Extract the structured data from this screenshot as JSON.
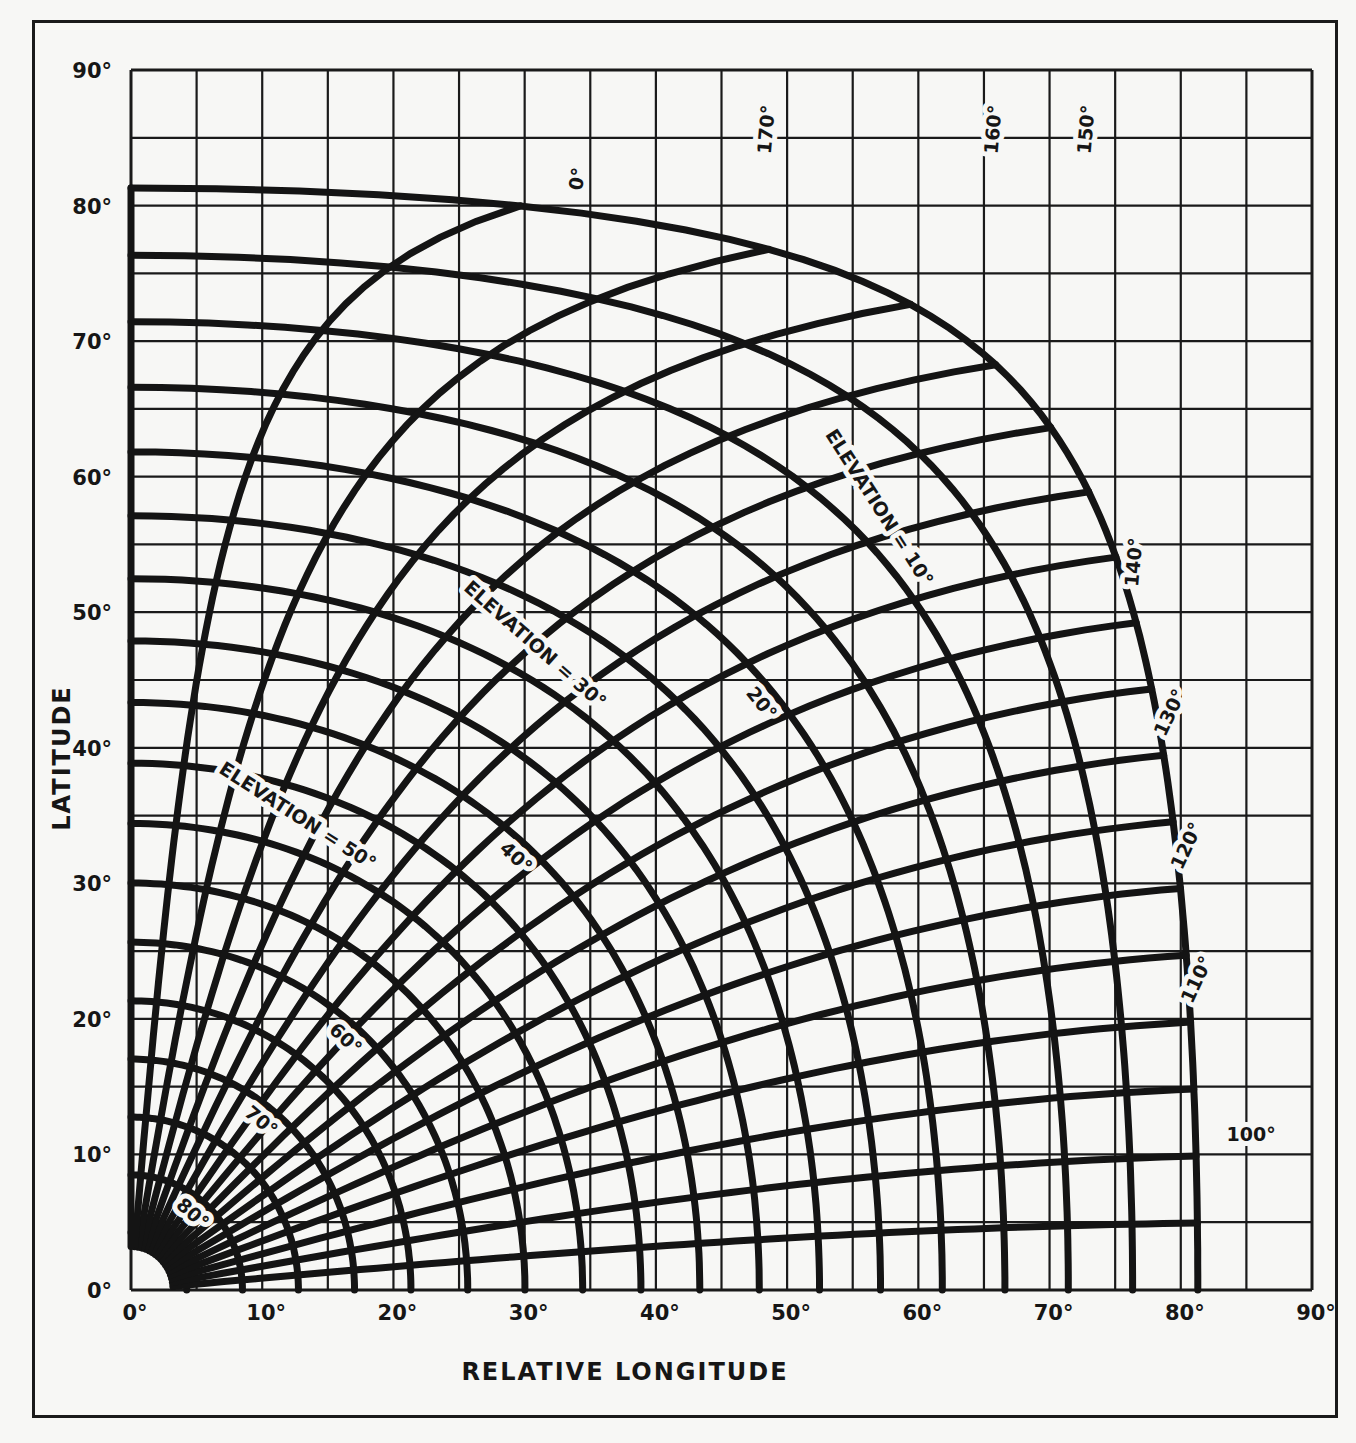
{
  "chart_data": {
    "type": "line",
    "title": "",
    "xlabel": "RELATIVE LONGITUDE",
    "ylabel": "LATITUDE",
    "xlim": [
      0,
      90
    ],
    "ylim": [
      0,
      90
    ],
    "grid": true,
    "grid_spacing_deg": 5,
    "x_ticks": [
      "0°",
      "10°",
      "20°",
      "30°",
      "40°",
      "50°",
      "60°",
      "70°",
      "80°",
      "90°"
    ],
    "y_ticks": [
      "0°",
      "10°",
      "20°",
      "30°",
      "40°",
      "50°",
      "60°",
      "70°",
      "80°",
      "90°"
    ],
    "elevation_curves_deg": [
      0,
      5,
      10,
      15,
      20,
      25,
      30,
      35,
      40,
      45,
      50,
      55,
      60,
      65,
      70,
      75,
      80,
      85
    ],
    "azimuth_curves_deg": [
      95,
      100,
      105,
      110,
      115,
      120,
      125,
      130,
      135,
      140,
      145,
      150,
      155,
      160,
      165,
      170,
      175,
      180
    ],
    "elevation_labels": [
      {
        "text": "ELEVATION = 10°",
        "value": 10
      },
      {
        "text": "20°",
        "value": 20
      },
      {
        "text": "ELEVATION = 30°",
        "value": 30
      },
      {
        "text": "40°",
        "value": 40
      },
      {
        "text": "ELEVATION = 50°",
        "value": 50
      },
      {
        "text": "60°",
        "value": 60
      },
      {
        "text": "70°",
        "value": 70
      },
      {
        "text": "80°",
        "value": 80
      }
    ],
    "azimuth_labels": [
      {
        "text": "170°",
        "value": 170
      },
      {
        "text": "160°",
        "value": 160
      },
      {
        "text": "150°",
        "value": 150
      },
      {
        "text": "0°",
        "value": 0
      },
      {
        "text": "140°",
        "value": 140
      },
      {
        "text": "130°",
        "value": 130
      },
      {
        "text": "120°",
        "value": 120
      },
      {
        "text": "110°",
        "value": 110
      },
      {
        "text": "100°",
        "value": 100
      }
    ],
    "max_coverage_central_angle_deg": 81.3,
    "orbit_ratio_k": 0.1513
  },
  "axes": {
    "x_title": "RELATIVE LONGITUDE",
    "y_title": "LATITUDE"
  }
}
